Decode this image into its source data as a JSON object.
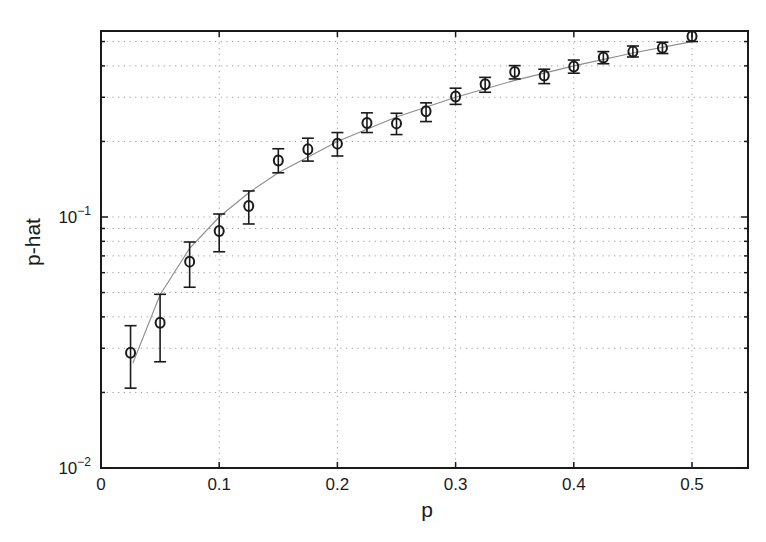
{
  "chart_data": {
    "type": "scatter",
    "title": "",
    "xlabel": "p",
    "ylabel": "p-hat",
    "xscale": "linear",
    "yscale": "log",
    "xlim": [
      0,
      0.55
    ],
    "ylim": [
      0.01,
      0.55
    ],
    "grid": true,
    "legend": null,
    "x_ticks": [
      0,
      0.1,
      0.2,
      0.3,
      0.4,
      0.5
    ],
    "x_tick_labels": [
      "0",
      "0.1",
      "0.2",
      "0.3",
      "0.4",
      "0.5"
    ],
    "y_ticks": [
      0.01,
      0.1
    ],
    "y_tick_labels": [
      {
        "base": "10",
        "exp": "−2"
      },
      {
        "base": "10",
        "exp": "−1"
      }
    ],
    "y_minor_gridlines": [
      0.02,
      0.03,
      0.04,
      0.05,
      0.06,
      0.07,
      0.08,
      0.09,
      0.2,
      0.3,
      0.4,
      0.5
    ],
    "series": [
      {
        "name": "estimate (circles with error bars)",
        "marker": "circle",
        "x": [
          0.025,
          0.05,
          0.075,
          0.1,
          0.125,
          0.15,
          0.175,
          0.2,
          0.225,
          0.25,
          0.275,
          0.3,
          0.325,
          0.35,
          0.375,
          0.4,
          0.425,
          0.45,
          0.475,
          0.5
        ],
        "y": [
          0.0288,
          0.0379,
          0.0664,
          0.0879,
          0.1106,
          0.168,
          0.186,
          0.196,
          0.237,
          0.236,
          0.264,
          0.302,
          0.338,
          0.378,
          0.366,
          0.398,
          0.432,
          0.456,
          0.472,
          0.525
        ],
        "y_lower": [
          0.0208,
          0.0265,
          0.0525,
          0.0727,
          0.0938,
          0.15,
          0.167,
          0.175,
          0.217,
          0.213,
          0.24,
          0.281,
          0.314,
          0.355,
          0.34,
          0.374,
          0.408,
          0.434,
          0.448,
          0.5
        ],
        "y_upper": [
          0.0369,
          0.0492,
          0.0795,
          0.1028,
          0.127,
          0.187,
          0.206,
          0.217,
          0.26,
          0.259,
          0.285,
          0.326,
          0.36,
          0.401,
          0.388,
          0.422,
          0.456,
          0.48,
          0.497,
          0.55
        ]
      },
      {
        "name": "reference line (p-hat = p)",
        "marker": "none",
        "line": "solid-thin-gray",
        "x": [
          0.027,
          0.05,
          0.075,
          0.1,
          0.125,
          0.15,
          0.2,
          0.25,
          0.3,
          0.35,
          0.4,
          0.45,
          0.5
        ],
        "y": [
          0.0262,
          0.049,
          0.075,
          0.1,
          0.125,
          0.15,
          0.2,
          0.25,
          0.3,
          0.35,
          0.4,
          0.45,
          0.5
        ]
      }
    ]
  }
}
